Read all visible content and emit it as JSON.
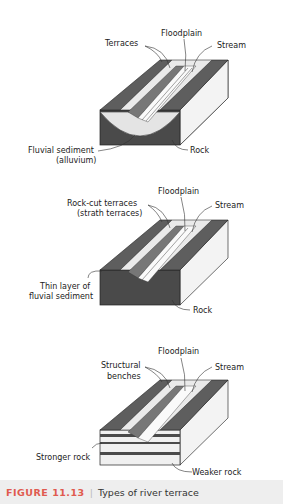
{
  "panels": [
    {
      "type": "fill terraces",
      "labels": {
        "terraces": "Terraces",
        "floodplain": "Floodplain",
        "stream": "Stream",
        "sediment_1": "Fluvial sediment",
        "sediment_2": "(alluvium)",
        "rock": "Rock"
      }
    },
    {
      "type": "strath terraces",
      "labels": {
        "terraces_1": "Rock-cut terraces",
        "terraces_2": "(strath terraces)",
        "floodplain": "Floodplain",
        "stream": "Stream",
        "thin_1": "Thin layer of",
        "thin_2": "fluvial sediment",
        "rock": "Rock"
      }
    },
    {
      "type": "structural benches",
      "labels": {
        "benches_1": "Structural",
        "benches_2": "benches",
        "floodplain": "Floodplain",
        "stream": "Stream",
        "stronger": "Stronger rock",
        "weaker": "Weaker rock"
      }
    }
  ],
  "caption": {
    "figure_number": "FIGURE 11.13",
    "separator": "|",
    "title": "Types of river terrace"
  },
  "colors": {
    "rock_dark": "#4a4a4a",
    "top_surface": "#5e5e5e",
    "sediment": "#e6e6e6",
    "side_face": "#f2f2f2",
    "caption_bg": "#eeeeee",
    "caption_accent": "#e05a4f"
  }
}
